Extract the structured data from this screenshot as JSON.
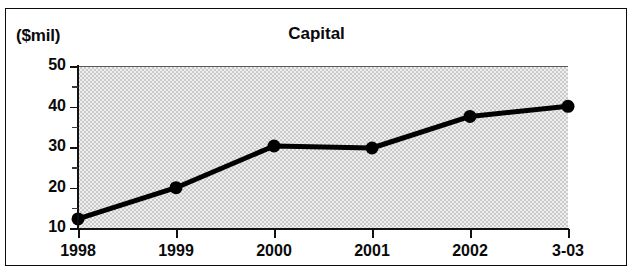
{
  "chart_data": {
    "type": "line",
    "title": "Capital",
    "ylabel": "($mil)",
    "xlabel": "",
    "categories": [
      "1998",
      "1999",
      "2000",
      "2001",
      "2002",
      "3-03"
    ],
    "values": [
      12.5,
      20.2,
      30.5,
      30.0,
      37.8,
      40.3
    ],
    "series": [
      {
        "name": "Capital",
        "values": [
          12.5,
          20.2,
          30.5,
          30.0,
          37.8,
          40.3
        ]
      }
    ],
    "ylim": [
      10,
      50
    ],
    "y_ticks": [
      10,
      20,
      30,
      40,
      50
    ],
    "y_tick_labels": [
      "10",
      "20",
      "30",
      "40",
      "50"
    ],
    "y_minor_ticks": [
      15,
      25,
      35,
      45
    ],
    "grid": false,
    "legend": "none",
    "marker": "circle",
    "line_color": "#000000",
    "plot_background": "#e6e6e6"
  }
}
